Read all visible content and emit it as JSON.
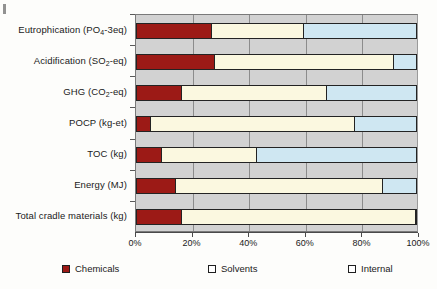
{
  "chart_data": {
    "type": "bar",
    "orientation": "horizontal",
    "stacked": true,
    "stack_mode": "percent",
    "title": "",
    "subtitle": "",
    "xlabel": "",
    "ylabel": "",
    "xlim": [
      0,
      100
    ],
    "xtick_labels": [
      "0%",
      "20%",
      "40%",
      "60%",
      "80%",
      "100%"
    ],
    "xtick_values": [
      0,
      20,
      40,
      60,
      80,
      100
    ],
    "grid": true,
    "grid_axis": "x",
    "legend_position": "bottom",
    "categories": [
      "Eutrophication (PO4-3eq)",
      "Acidification (SO2-eq)",
      "GHG (CO2-eq)",
      "POCP (kg-et)",
      "TOC (kg)",
      "Energy (MJ)",
      "Total cradle materials (kg)"
    ],
    "category_labels_html": [
      "Eutrophication (PO<sub>4</sub>-3eq)",
      "Acidification (SO<sub>2</sub>-eq)",
      "GHG (CO<sub>2</sub>-eq)",
      "POCP (kg-et)",
      "TOC (kg)",
      "Energy (MJ)",
      "Total cradle materials (kg)"
    ],
    "series": [
      {
        "name": "Chemicals",
        "color": "#9c1a16",
        "values": [
          27,
          28,
          16,
          5,
          9,
          14,
          16
        ]
      },
      {
        "name": "Solvents",
        "color": "#fbf8e0",
        "values": [
          33,
          64,
          52,
          73,
          34,
          74,
          84
        ]
      },
      {
        "name": "Internal",
        "color": "#cfe7f2",
        "values": [
          40,
          8,
          32,
          22,
          57,
          12,
          0
        ]
      }
    ]
  },
  "legend": {
    "items": [
      {
        "label": "Chemicals",
        "swatch": "chemicals"
      },
      {
        "label": "Solvents",
        "swatch": "solvents"
      },
      {
        "label": "Internal",
        "swatch": "internal"
      }
    ]
  },
  "axis": {
    "x_ticks": [
      {
        "label": "0%"
      },
      {
        "label": "20%"
      },
      {
        "label": "40%"
      },
      {
        "label": "60%"
      },
      {
        "label": "80%"
      },
      {
        "label": "100%"
      }
    ]
  },
  "colors": {
    "chemicals": "#9c1a16",
    "solvents": "#fbf8e0",
    "internal": "#cfe7f2",
    "plot_background": "#d2d2d2",
    "gridline": "#8c8c8c",
    "outline": "#232323"
  }
}
